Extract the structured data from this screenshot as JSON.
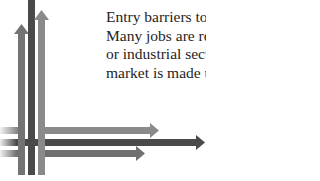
{
  "text": {
    "lines": [
      "Entry barriers to",
      "Many jobs are re",
      "or industrial sect",
      "market is made u"
    ]
  },
  "graphic": {
    "icon": "crossing-arrows-icon",
    "colors": {
      "dark": "#4a4a4a",
      "medium": "#707070",
      "light": "#8a8a8a"
    }
  }
}
